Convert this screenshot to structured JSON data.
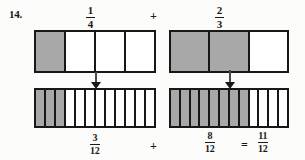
{
  "problem": {
    "number": "14."
  },
  "operators": {
    "plus_top": "+",
    "plus_bottom": "+",
    "equals": "="
  },
  "fractions": {
    "top_left": {
      "numerator": "1",
      "denominator": "4"
    },
    "top_right": {
      "numerator": "2",
      "denominator": "3"
    },
    "bottom_left": {
      "numerator": "3",
      "denominator": "12"
    },
    "bottom_right": {
      "numerator": "8",
      "denominator": "12"
    },
    "result": {
      "numerator": "11",
      "denominator": "12"
    }
  },
  "icons": {
    "arrow_left": "arrow-down-icon",
    "arrow_right": "arrow-down-icon"
  },
  "colors": {
    "shaded": "#a8a8a8",
    "outline": "#171717",
    "background": "#fcfcfa",
    "arrow": "#1a1a1a"
  },
  "chart_data": {
    "type": "bar",
    "models": [
      {
        "name": "top-left-fraction-bar",
        "label": "1/4",
        "total_parts": 4,
        "shaded_parts": 1,
        "cells": [
          1,
          0,
          0,
          0
        ]
      },
      {
        "name": "top-right-fraction-bar",
        "label": "2/3",
        "total_parts": 3,
        "shaded_parts": 2,
        "cells": [
          1,
          1,
          0
        ]
      },
      {
        "name": "bottom-left-fraction-bar",
        "label": "3/12",
        "total_parts": 12,
        "shaded_parts": 3,
        "cells": [
          1,
          1,
          1,
          0,
          0,
          0,
          0,
          0,
          0,
          0,
          0,
          0
        ]
      },
      {
        "name": "bottom-right-fraction-bar",
        "label": "8/12",
        "total_parts": 12,
        "shaded_parts": 8,
        "cells": [
          1,
          1,
          1,
          1,
          1,
          1,
          1,
          1,
          0,
          0,
          0,
          0
        ]
      }
    ],
    "equation": "3/12 + 8/12 = 11/12"
  }
}
